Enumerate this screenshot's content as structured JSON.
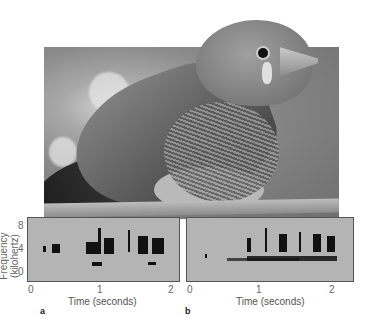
{
  "figure": {
    "photo_subject": "Zebra finch perched on branch",
    "ylabel": "Frequency (kilohertz)",
    "yticks": [
      "8",
      "4",
      "0"
    ],
    "panels": [
      {
        "letter": "a",
        "xlabel": "Time (seconds)",
        "xticks": [
          "0",
          "1",
          "2"
        ]
      },
      {
        "letter": "b",
        "xlabel": "Time (seconds)",
        "xticks": [
          "0",
          "1",
          "2"
        ]
      }
    ]
  }
}
